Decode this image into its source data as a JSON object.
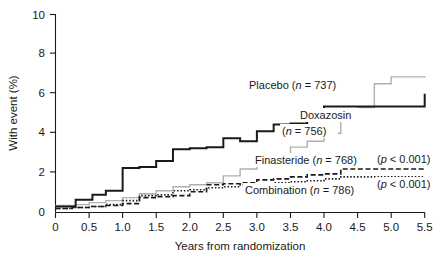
{
  "figure": {
    "title": "",
    "background": "#ffffff"
  },
  "axes": {
    "y_title": "With event (%)",
    "x_title": "Years from randomization",
    "y_ticks": [
      "0",
      "2",
      "4",
      "6",
      "8",
      "10"
    ],
    "x_ticks": [
      "0",
      "0.5",
      "1.0",
      "1.5",
      "2.0",
      "2.5",
      "3.0",
      "3.5",
      "4.0",
      "4.5",
      "5.0",
      "5.5"
    ]
  },
  "labels": {
    "placebo": "Placebo (",
    "placebo_n": "n",
    "placebo_tail": " = 737)",
    "doxazosin": "Doxazosin",
    "doxazosin_n": "n",
    "doxazosin_tail": " = 756)",
    "doxazosin_open": "(",
    "finasteride": "Finasteride (",
    "finasteride_n": "n",
    "finasteride_tail": " = 768)",
    "combination": "Combination (",
    "combination_n": "n",
    "combination_tail": " = 786)",
    "pvalue_finasteride_open": "(",
    "pvalue_finasteride_p": "p",
    "pvalue_finasteride_tail": " < 0.001)",
    "pvalue_combination_open": "(",
    "pvalue_combination_p": "p",
    "pvalue_combination_tail": " < 0.001)"
  },
  "chart_data": {
    "type": "line",
    "title": "",
    "xlabel": "Years from randomization",
    "ylabel": "With event (%)",
    "xlim": [
      0,
      5.5
    ],
    "ylim": [
      0,
      10
    ],
    "xticks": [
      0,
      0.5,
      1.0,
      1.5,
      2.0,
      2.5,
      3.0,
      3.5,
      4.0,
      4.5,
      5.0,
      5.5
    ],
    "yticks": [
      0,
      2,
      4,
      6,
      8,
      10
    ],
    "grid": false,
    "legend_position": "inline-annotations",
    "step_style": "post",
    "series": [
      {
        "name": "Placebo (n = 737)",
        "n": 737,
        "color": "#1a1a1a",
        "linestyle": "solid",
        "linewidth": 2.0,
        "x": [
          0,
          0.3,
          0.55,
          0.75,
          1.0,
          1.25,
          1.5,
          1.75,
          2.0,
          2.25,
          2.5,
          2.75,
          3.0,
          3.25,
          3.5,
          3.75,
          4.0,
          5.5
        ],
        "y": [
          0.3,
          0.65,
          0.9,
          1.1,
          2.25,
          2.3,
          2.6,
          3.2,
          3.25,
          3.3,
          3.75,
          3.6,
          4.1,
          4.45,
          4.5,
          5.15,
          5.35,
          6.0
        ]
      },
      {
        "name": "Doxazosin (n = 756)",
        "n": 756,
        "color": "#b0b0b0",
        "linestyle": "solid",
        "linewidth": 1.4,
        "x": [
          0,
          0.3,
          0.5,
          0.75,
          1.0,
          1.25,
          1.5,
          1.75,
          2.0,
          2.25,
          2.5,
          2.75,
          3.0,
          3.25,
          3.5,
          3.75,
          4.0,
          4.25,
          4.5,
          4.75,
          5.0,
          5.5
        ],
        "y": [
          0.35,
          0.4,
          0.5,
          0.6,
          0.75,
          0.95,
          1.1,
          1.3,
          1.4,
          1.5,
          1.85,
          2.2,
          2.5,
          2.9,
          3.3,
          3.6,
          4.0,
          4.6,
          5.3,
          6.5,
          6.85,
          6.9
        ]
      },
      {
        "name": "Finasteride (n = 768)",
        "n": 768,
        "color": "#1a1a1a",
        "linestyle": "dashed",
        "linewidth": 1.6,
        "x": [
          0,
          0.25,
          0.5,
          0.75,
          1.0,
          1.25,
          1.5,
          1.75,
          2.0,
          2.25,
          2.5,
          2.75,
          3.0,
          3.25,
          3.5,
          3.75,
          4.0,
          4.25,
          5.5
        ],
        "y": [
          0.2,
          0.25,
          0.3,
          0.35,
          0.45,
          0.75,
          0.8,
          0.85,
          1.05,
          1.4,
          1.45,
          1.5,
          1.65,
          1.7,
          1.8,
          1.9,
          1.95,
          2.2,
          2.2
        ]
      },
      {
        "name": "Combination (n = 786)",
        "n": 786,
        "color": "#1a1a1a",
        "linestyle": "dotted",
        "linewidth": 1.6,
        "x": [
          0,
          0.25,
          0.5,
          0.75,
          1.0,
          1.25,
          1.5,
          1.75,
          2.0,
          2.25,
          2.5,
          2.75,
          3.0,
          3.25,
          3.5,
          3.75,
          4.0,
          4.25,
          5.5
        ],
        "y": [
          0.2,
          0.25,
          0.3,
          0.4,
          0.6,
          0.85,
          0.9,
          1.1,
          1.15,
          1.25,
          1.3,
          1.4,
          1.45,
          1.5,
          1.55,
          1.6,
          1.7,
          1.8,
          1.8
        ]
      }
    ],
    "annotations": [
      {
        "text": "Placebo (n = 737)",
        "x": 3.2,
        "y": 6.3
      },
      {
        "text": "Doxazosin",
        "x": 3.55,
        "y": 4.75
      },
      {
        "text": "(n = 756)",
        "x": 3.4,
        "y": 4.0
      },
      {
        "text": "Finasteride (n = 768)",
        "x": 3.1,
        "y": 2.45
      },
      {
        "text": "Combination (n = 786)",
        "x": 3.0,
        "y": 1.25
      },
      {
        "text": "(p < 0.001)",
        "x": 4.75,
        "y": 2.45
      },
      {
        "text": "(p < 0.001)",
        "x": 4.75,
        "y": 1.3
      }
    ]
  }
}
